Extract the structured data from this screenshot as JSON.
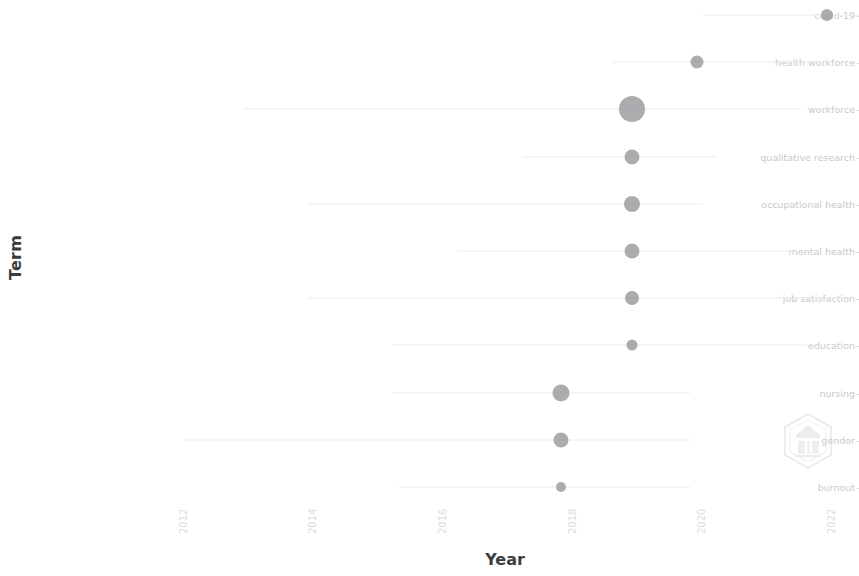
{
  "chart_data": {
    "type": "scatter",
    "title": "",
    "xlabel": "Year",
    "ylabel": "Term",
    "grid": false,
    "legend": "none",
    "xlim": [
      2011.0,
      2022.4
    ],
    "x_ticks": [
      "2012",
      "2014",
      "2016",
      "2018",
      "2020",
      "2022"
    ],
    "x_tick_values": [
      2012,
      2014,
      2016,
      2018,
      2020,
      2022
    ],
    "categories": [
      "covid-19",
      "health workforce",
      "workforce",
      "qualitative research",
      "occupational health",
      "mental health",
      "job satisfaction",
      "education",
      "nursing",
      "gender",
      "burnout"
    ],
    "series": [
      {
        "name": "Mean publication year (dot size = frequency)",
        "points": [
          {
            "term": "covid-19",
            "year": 2021.9,
            "size": 12,
            "range_start": 2020.0,
            "range_end": 2022.4
          },
          {
            "term": "health workforce",
            "year": 2019.9,
            "size": 13,
            "range_start": 2018.6,
            "range_end": 2021.8
          },
          {
            "term": "workforce",
            "year": 2018.9,
            "size": 26,
            "range_start": 2012.9,
            "range_end": 2021.5
          },
          {
            "term": "qualitative research",
            "year": 2018.9,
            "size": 15,
            "range_start": 2017.2,
            "range_end": 2020.2
          },
          {
            "term": "occupational health",
            "year": 2018.9,
            "size": 16,
            "range_start": 2013.9,
            "range_end": 2020.0
          },
          {
            "term": "mental health",
            "year": 2018.9,
            "size": 15,
            "range_start": 2016.2,
            "range_end": 2021.4
          },
          {
            "term": "job satisfaction",
            "year": 2018.9,
            "size": 14,
            "range_start": 2013.9,
            "range_end": 2022.1
          },
          {
            "term": "education",
            "year": 2018.9,
            "size": 11,
            "range_start": 2015.2,
            "range_end": 2021.6
          },
          {
            "term": "nursing",
            "year": 2017.8,
            "size": 17,
            "range_start": 2015.2,
            "range_end": 2019.8
          },
          {
            "term": "gender",
            "year": 2017.8,
            "size": 15,
            "range_start": 2012.0,
            "range_end": 2019.8
          },
          {
            "term": "burnout",
            "year": 2017.8,
            "size": 10,
            "range_start": 2015.3,
            "range_end": 2019.8
          }
        ]
      }
    ],
    "colors": {
      "dot": "#9a9a9d",
      "line": "#ebebee",
      "axis_title": "#3c3c3c",
      "tick_label": "#c9c9cc"
    }
  },
  "watermark": {
    "name": "hexagon-logo-watermark",
    "present": true
  }
}
